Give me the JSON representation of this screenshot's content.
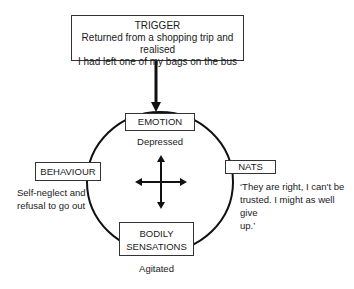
{
  "diagram": {
    "trigger": {
      "title": "TRIGGER",
      "line1": "Returned from a shopping trip and realised",
      "line2": "I had left one of my bags on the bus"
    },
    "emotion": {
      "title": "EMOTION",
      "description": "Depressed"
    },
    "behaviour": {
      "title": "BEHAVIOUR",
      "line1": "Self-neglect and",
      "line2": "refusal to go out"
    },
    "nats": {
      "title": "NATS",
      "line1": "‘They are right, I can't be",
      "line2": "trusted. I might as well give",
      "line3": "up.’"
    },
    "bodily": {
      "title_line1": "BODILY",
      "title_line2": "SENSATIONS",
      "description": "Agitated"
    },
    "colors": {
      "line": "#111111",
      "box_border": "#333333",
      "background": "#ffffff"
    }
  }
}
